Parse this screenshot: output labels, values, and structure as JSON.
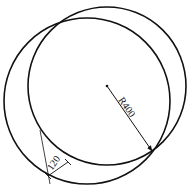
{
  "diagram": {
    "type": "two intersecting circles with dimensions",
    "main_circle": {
      "cx": 107,
      "cy": 86,
      "r": 79
    },
    "offset_circle": {
      "cx": 87,
      "cy": 101,
      "r": 83
    },
    "radius_dimension": {
      "label": "R400"
    },
    "gap_dimension": {
      "label": "120"
    },
    "colors": {
      "stroke": "#111111",
      "background": "#ffffff"
    }
  }
}
